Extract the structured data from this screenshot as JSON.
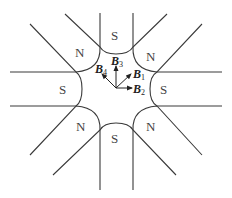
{
  "diagram": {
    "poles": [
      {
        "position": "top",
        "label": "S"
      },
      {
        "position": "top-right",
        "label": "N"
      },
      {
        "position": "right",
        "label": "S"
      },
      {
        "position": "bottom-right",
        "label": "N"
      },
      {
        "position": "bottom",
        "label": "S"
      },
      {
        "position": "bottom-left",
        "label": "N"
      },
      {
        "position": "left",
        "label": "S"
      },
      {
        "position": "top-left",
        "label": "N"
      }
    ],
    "vectors": [
      {
        "name": "B",
        "sub": "1",
        "direction": "up-right (45°)"
      },
      {
        "name": "B",
        "sub": "2",
        "direction": "right (0°)"
      },
      {
        "name": "B",
        "sub": "3",
        "direction": "up (90°)"
      },
      {
        "name": "B",
        "sub": "4",
        "direction": "up-left (135°)"
      }
    ],
    "colors": {
      "line": "#3a3a3a",
      "text": "#444444",
      "background": "#ffffff"
    }
  }
}
